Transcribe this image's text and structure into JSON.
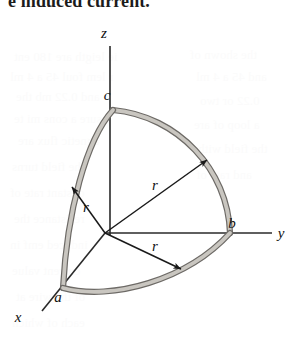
{
  "page": {
    "header_text": "e induced current.",
    "background_color": "#ffffff",
    "width": 307,
    "height": 344
  },
  "figure": {
    "name": "spherical-octant-wire-loop",
    "axes": [
      {
        "id": "z",
        "label": "z",
        "label_x": 104,
        "label_y": 38,
        "x1": 110,
        "y1": 46,
        "x2": 110,
        "y2": 235
      },
      {
        "id": "y",
        "label": "y",
        "label_x": 281,
        "label_y": 238,
        "x1": 105,
        "y1": 233,
        "x2": 272,
        "y2": 233
      },
      {
        "id": "x",
        "label": "x",
        "label_x": 18,
        "label_y": 322,
        "x1": 105,
        "y1": 233,
        "x2": 42,
        "y2": 311
      }
    ],
    "points": [
      {
        "id": "c",
        "label": "c",
        "label_x": 107,
        "label_y": 100,
        "px": 113,
        "py": 110
      },
      {
        "id": "b",
        "label": "b",
        "label_x": 232,
        "label_y": 228,
        "px": 230,
        "py": 233
      },
      {
        "id": "a",
        "label": "a",
        "label_x": 58,
        "label_y": 302,
        "px": 63,
        "py": 288
      }
    ],
    "radii": [
      {
        "id": "r-upper-left",
        "label": "r",
        "label_x": 86,
        "label_y": 212,
        "x1": 105,
        "y1": 233,
        "x2": 72,
        "y2": 187
      },
      {
        "id": "r-upper-right",
        "label": "r",
        "label_x": 155,
        "label_y": 190,
        "x1": 105,
        "y1": 233,
        "x2": 207,
        "y2": 160
      },
      {
        "id": "r-lower-right",
        "label": "r",
        "label_x": 155,
        "label_y": 251,
        "x1": 105,
        "y1": 233,
        "x2": 181,
        "y2": 269
      }
    ],
    "colors": {
      "wire_fill": "#c9c6c0",
      "wire_stroke": "#6d6a66",
      "axis_stroke": "#2a2a2a",
      "arrow_stroke": "#1a1a1a",
      "label_color": "#111111",
      "header_color": "#1c1c1c",
      "ghost_text_color": "#fbfbfb"
    }
  },
  "ghost_text": {
    "note": "faint show-through text from reverse of printed page",
    "lines": [
      {
        "text": "ie leigth are 180 ent",
        "x": 14,
        "y": 48
      },
      {
        "text": "r lem foul 45 a 4 ml",
        "x": 10,
        "y": 68
      },
      {
        "text": "and 0.22 mb the",
        "x": 16,
        "y": 88
      },
      {
        "text": "sure a cons mi te",
        "x": 14,
        "y": 110
      },
      {
        "text": "agnetic flux are",
        "x": 18,
        "y": 132
      },
      {
        "text": "the field turns",
        "x": 12,
        "y": 158
      },
      {
        "text": "onstant rate of",
        "x": 10,
        "y": 184
      },
      {
        "text": "resistance the",
        "x": 14,
        "y": 210
      },
      {
        "text": "induced emf in",
        "x": 10,
        "y": 236
      },
      {
        "text": "current value",
        "x": 12,
        "y": 262
      },
      {
        "text": "of the wire at",
        "x": 16,
        "y": 288
      },
      {
        "text": "each of which",
        "x": 12,
        "y": 314
      },
      {
        "text": "the shown of",
        "x": 190,
        "y": 46
      },
      {
        "text": "and 45 a 4 ml",
        "x": 196,
        "y": 68
      },
      {
        "text": "0.22 or two",
        "x": 200,
        "y": 92
      },
      {
        "text": "a loop of are",
        "x": 194,
        "y": 116
      },
      {
        "text": "the field with",
        "x": 198,
        "y": 140
      },
      {
        "text": "and rate of",
        "x": 196,
        "y": 166
      }
    ]
  }
}
